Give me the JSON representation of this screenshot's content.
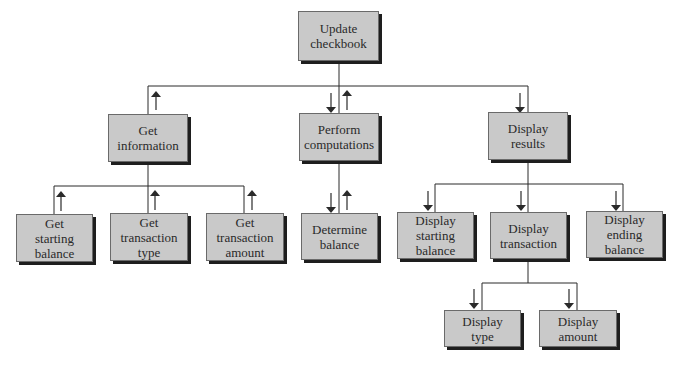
{
  "diagram": {
    "type": "structure-chart",
    "colors": {
      "box_fill": "#c9c9c9",
      "box_border": "#6a6a6a",
      "box_shadow": "#1e1e1e",
      "line": "#2a2a2a",
      "text": "#2a2a2a"
    },
    "nodes": {
      "root": {
        "label": "Update\ncheckbook"
      },
      "get_information": {
        "label": "Get\ninformation"
      },
      "perform_computations": {
        "label": "Perform\ncomputations"
      },
      "display_results": {
        "label": "Display\nresults"
      },
      "get_starting_balance": {
        "label": "Get\nstarting\nbalance"
      },
      "get_transaction_type": {
        "label": "Get\ntransaction\ntype"
      },
      "get_transaction_amount": {
        "label": "Get\ntransaction\namount"
      },
      "determine_balance": {
        "label": "Determine\nbalance"
      },
      "display_starting_balance": {
        "label": "Display\nstarting\nbalance"
      },
      "display_transaction": {
        "label": "Display\ntransaction"
      },
      "display_ending_balance": {
        "label": "Display\nending\nbalance"
      },
      "display_type": {
        "label": "Display\ntype"
      },
      "display_amount": {
        "label": "Display\namount"
      }
    },
    "edges": [
      {
        "from": "root",
        "to": "get_information",
        "flow": [
          "up"
        ]
      },
      {
        "from": "root",
        "to": "perform_computations",
        "flow": [
          "down",
          "up"
        ]
      },
      {
        "from": "root",
        "to": "display_results",
        "flow": [
          "down"
        ]
      },
      {
        "from": "get_information",
        "to": "get_starting_balance",
        "flow": [
          "up"
        ]
      },
      {
        "from": "get_information",
        "to": "get_transaction_type",
        "flow": [
          "up"
        ]
      },
      {
        "from": "get_information",
        "to": "get_transaction_amount",
        "flow": [
          "up"
        ]
      },
      {
        "from": "perform_computations",
        "to": "determine_balance",
        "flow": [
          "down",
          "up"
        ]
      },
      {
        "from": "display_results",
        "to": "display_starting_balance",
        "flow": [
          "down"
        ]
      },
      {
        "from": "display_results",
        "to": "display_transaction",
        "flow": [
          "down"
        ]
      },
      {
        "from": "display_results",
        "to": "display_ending_balance",
        "flow": [
          "down"
        ]
      },
      {
        "from": "display_transaction",
        "to": "display_type",
        "flow": [
          "down"
        ]
      },
      {
        "from": "display_transaction",
        "to": "display_amount",
        "flow": [
          "down"
        ]
      }
    ]
  }
}
